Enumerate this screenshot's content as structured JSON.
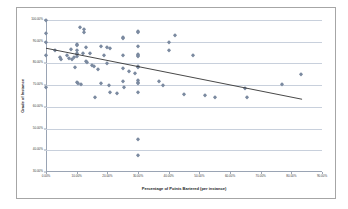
{
  "chart_data": {
    "type": "scatter",
    "title": "",
    "xlabel": "Percentage of Points Bartered (per instance)",
    "ylabel": "Grade of Instance",
    "xlim": [
      0,
      90
    ],
    "ylim": [
      30,
      100
    ],
    "grid": "horizontal",
    "legend": "none",
    "marker_color": "#7b8aa0",
    "trendline_color": "#333333",
    "gridline_color": "#c8d0dc",
    "xticks": [
      "0.00%",
      "10.00%",
      "20.00%",
      "30.00%",
      "40.00%",
      "50.00%",
      "60.00%",
      "70.00%",
      "80.00%",
      "90.00%"
    ],
    "xtick_values": [
      0,
      10,
      20,
      30,
      40,
      50,
      60,
      70,
      80,
      90
    ],
    "yticks": [
      "30.00%",
      "40.00%",
      "50.00%",
      "60.00%",
      "70.00%",
      "80.00%",
      "90.00%",
      "100.00%"
    ],
    "ytick_values": [
      30,
      40,
      50,
      60,
      70,
      80,
      90,
      100
    ],
    "trendline": {
      "x0": 0,
      "y0": 87.0,
      "x1": 83.5,
      "y1": 63.5
    },
    "points": [
      [
        0.0,
        100.0
      ],
      [
        0.0,
        94.0
      ],
      [
        0.0,
        90.0
      ],
      [
        0.0,
        84.0
      ],
      [
        0.0,
        69.0
      ],
      [
        3.0,
        86.0
      ],
      [
        4.5,
        83.0
      ],
      [
        5.0,
        82.0
      ],
      [
        7.0,
        84.0
      ],
      [
        7.5,
        82.5
      ],
      [
        8.0,
        86.5
      ],
      [
        8.5,
        82.0
      ],
      [
        9.0,
        83.0
      ],
      [
        9.5,
        78.5
      ],
      [
        10.0,
        89.0
      ],
      [
        10.0,
        88.5
      ],
      [
        10.0,
        86.0
      ],
      [
        10.0,
        85.0
      ],
      [
        10.0,
        84.5
      ],
      [
        10.0,
        83.5
      ],
      [
        10.0,
        71.5
      ],
      [
        10.5,
        71.0
      ],
      [
        11.0,
        97.0
      ],
      [
        11.5,
        70.5
      ],
      [
        12.0,
        85.0
      ],
      [
        12.5,
        96.0
      ],
      [
        12.5,
        94.5
      ],
      [
        13.0,
        87.5
      ],
      [
        13.0,
        81.0
      ],
      [
        13.5,
        80.5
      ],
      [
        14.5,
        85.0
      ],
      [
        15.0,
        79.5
      ],
      [
        15.5,
        79.0
      ],
      [
        16.0,
        64.5
      ],
      [
        17.0,
        77.5
      ],
      [
        18.0,
        88.0
      ],
      [
        18.0,
        71.0
      ],
      [
        19.0,
        84.0
      ],
      [
        20.0,
        87.5
      ],
      [
        20.0,
        80.0
      ],
      [
        20.5,
        70.0
      ],
      [
        21.0,
        87.0
      ],
      [
        21.0,
        67.0
      ],
      [
        23.0,
        66.5
      ],
      [
        25.0,
        92.0
      ],
      [
        25.0,
        91.5
      ],
      [
        25.0,
        84.0
      ],
      [
        25.0,
        78.0
      ],
      [
        25.0,
        72.0
      ],
      [
        25.5,
        69.0
      ],
      [
        27.0,
        76.5
      ],
      [
        29.0,
        75.5
      ],
      [
        30.0,
        95.0
      ],
      [
        30.0,
        94.5
      ],
      [
        30.0,
        88.0
      ],
      [
        30.0,
        84.5
      ],
      [
        30.0,
        84.0
      ],
      [
        30.0,
        83.5
      ],
      [
        30.0,
        79.0
      ],
      [
        30.0,
        78.5
      ],
      [
        30.0,
        72.5
      ],
      [
        30.0,
        71.5
      ],
      [
        30.0,
        71.0
      ],
      [
        30.0,
        67.0
      ],
      [
        30.0,
        45.0
      ],
      [
        30.0,
        38.0
      ],
      [
        37.0,
        72.0
      ],
      [
        38.0,
        70.0
      ],
      [
        40.0,
        90.0
      ],
      [
        40.0,
        86.0
      ],
      [
        42.0,
        93.0
      ],
      [
        45.0,
        66.0
      ],
      [
        48.0,
        84.0
      ],
      [
        52.0,
        65.5
      ],
      [
        55.0,
        64.5
      ],
      [
        65.0,
        68.5
      ],
      [
        65.5,
        64.5
      ],
      [
        77.0,
        70.5
      ],
      [
        83.0,
        75.0
      ]
    ]
  }
}
